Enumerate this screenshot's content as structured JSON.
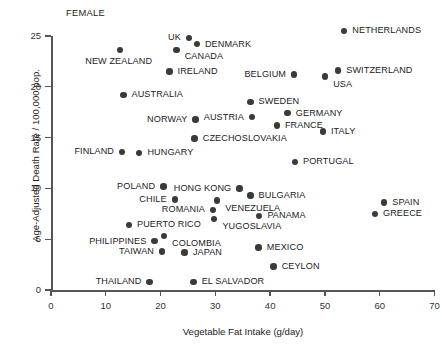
{
  "panel_label": "FEMALE",
  "chart_data": {
    "type": "scatter",
    "title": "",
    "panel_label": "FEMALE",
    "xlabel": "Vegetable Fat Intake (g/day)",
    "ylabel": "Age-Adjusted Death Rate / 100,000 pop.",
    "xlim": [
      0,
      70
    ],
    "ylim": [
      0,
      25
    ],
    "xticks": [
      "0",
      "10",
      "20",
      "30",
      "40",
      "50",
      "60",
      "70"
    ],
    "yticks": [
      "0",
      "5",
      "10",
      "15",
      "20",
      "25"
    ],
    "grid": false,
    "legend": "none",
    "marker_color": "#3a3a3a",
    "points": [
      {
        "name": "NETHERLANDS",
        "x": 53.5,
        "y": 25.5,
        "label_side": "right"
      },
      {
        "name": "UK",
        "x": 25.2,
        "y": 24.8,
        "label_side": "left"
      },
      {
        "name": "DENMARK",
        "x": 26.6,
        "y": 24.2,
        "label_side": "right"
      },
      {
        "name": "CANADA",
        "x": 22.9,
        "y": 23.6,
        "label_side": "right-below"
      },
      {
        "name": "NEW ZEALAND",
        "x": 12.6,
        "y": 23.6,
        "label_side": "below-left"
      },
      {
        "name": "SWITZERLAND",
        "x": 52.4,
        "y": 21.6,
        "label_side": "right"
      },
      {
        "name": "IRELAND",
        "x": 21.6,
        "y": 21.5,
        "label_side": "right"
      },
      {
        "name": "BELGIUM",
        "x": 44.4,
        "y": 21.2,
        "label_side": "left"
      },
      {
        "name": "USA",
        "x": 50.0,
        "y": 21.0,
        "label_side": "below-right"
      },
      {
        "name": "AUSTRALIA",
        "x": 13.2,
        "y": 19.2,
        "label_side": "right"
      },
      {
        "name": "SWEDEN",
        "x": 36.4,
        "y": 18.5,
        "label_side": "right"
      },
      {
        "name": "GERMANY",
        "x": 43.2,
        "y": 17.4,
        "label_side": "right"
      },
      {
        "name": "AUSTRIA",
        "x": 36.7,
        "y": 17.0,
        "label_side": "left"
      },
      {
        "name": "NORWAY",
        "x": 26.4,
        "y": 16.8,
        "label_side": "left"
      },
      {
        "name": "FRANCE",
        "x": 41.2,
        "y": 16.2,
        "label_side": "right"
      },
      {
        "name": "ITALY",
        "x": 49.6,
        "y": 15.6,
        "label_side": "right"
      },
      {
        "name": "CZECHOSLOVAKIA",
        "x": 26.2,
        "y": 14.9,
        "label_side": "right"
      },
      {
        "name": "FINLAND",
        "x": 13.0,
        "y": 13.6,
        "label_side": "left"
      },
      {
        "name": "HUNGARY",
        "x": 16.1,
        "y": 13.5,
        "label_side": "right"
      },
      {
        "name": "PORTUGAL",
        "x": 44.5,
        "y": 12.6,
        "label_side": "right"
      },
      {
        "name": "POLAND",
        "x": 20.5,
        "y": 10.2,
        "label_side": "left"
      },
      {
        "name": "HONG KONG",
        "x": 34.4,
        "y": 10.0,
        "label_side": "left"
      },
      {
        "name": "BULGARIA",
        "x": 36.4,
        "y": 9.3,
        "label_side": "right"
      },
      {
        "name": "CHILE",
        "x": 22.6,
        "y": 8.9,
        "label_side": "left"
      },
      {
        "name": "VENEZUELA",
        "x": 30.3,
        "y": 8.8,
        "label_side": "below-right"
      },
      {
        "name": "SPAIN",
        "x": 60.8,
        "y": 8.6,
        "label_side": "right"
      },
      {
        "name": "ROMANIA",
        "x": 29.6,
        "y": 7.9,
        "label_side": "left"
      },
      {
        "name": "GREECE",
        "x": 59.1,
        "y": 7.5,
        "label_side": "right"
      },
      {
        "name": "PANAMA",
        "x": 38.0,
        "y": 7.3,
        "label_side": "right"
      },
      {
        "name": "YUGOSLAVIA",
        "x": 29.8,
        "y": 7.0,
        "label_side": "below-right"
      },
      {
        "name": "PUERTO RICO",
        "x": 14.2,
        "y": 6.4,
        "label_side": "right"
      },
      {
        "name": "COLOMBIA",
        "x": 20.6,
        "y": 5.3,
        "label_side": "below-right"
      },
      {
        "name": "PHILIPPINES",
        "x": 18.9,
        "y": 4.8,
        "label_side": "left"
      },
      {
        "name": "MEXICO",
        "x": 37.9,
        "y": 4.2,
        "label_side": "right"
      },
      {
        "name": "TAIWAN",
        "x": 20.3,
        "y": 3.8,
        "label_side": "left"
      },
      {
        "name": "JAPAN",
        "x": 24.4,
        "y": 3.7,
        "label_side": "right"
      },
      {
        "name": "CEYLON",
        "x": 40.6,
        "y": 2.3,
        "label_side": "right"
      },
      {
        "name": "THAILAND",
        "x": 18.0,
        "y": 0.8,
        "label_side": "left"
      },
      {
        "name": "EL SALVADOR",
        "x": 26.0,
        "y": 0.8,
        "label_side": "right"
      }
    ]
  }
}
